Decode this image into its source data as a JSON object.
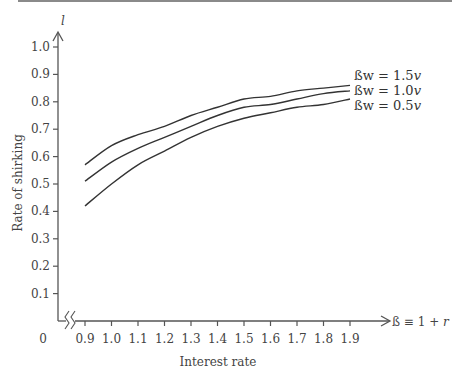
{
  "chart_data": {
    "type": "line",
    "title": "",
    "xlabel": "Interest rate",
    "ylabel": "Rate of shirking",
    "x_axis_symbol": "ß ≡ 1 + r",
    "y_axis_symbol": "l",
    "x_origin_label": "0",
    "x_axis_break": true,
    "xlim": [
      0.9,
      1.9
    ],
    "ylim": [
      0,
      1.0
    ],
    "x_ticks": [
      "0.9",
      "1.0",
      "1.1",
      "1.2",
      "1.3",
      "1.4",
      "1.5",
      "1.6",
      "1.7",
      "1.8",
      "1.9"
    ],
    "y_ticks": [
      "0.1",
      "0.2",
      "0.3",
      "0.4",
      "0.5",
      "0.6",
      "0.7",
      "0.8",
      "0.9",
      "1.0"
    ],
    "grid": false,
    "legend_position": "inline-right",
    "x": [
      0.9,
      1.0,
      1.1,
      1.2,
      1.3,
      1.4,
      1.5,
      1.6,
      1.7,
      1.8,
      1.9
    ],
    "series": [
      {
        "name": "ßw = 1.5v",
        "values": [
          0.57,
          0.64,
          0.68,
          0.71,
          0.75,
          0.78,
          0.81,
          0.82,
          0.84,
          0.85,
          0.86
        ]
      },
      {
        "name": "ßw = 1.0v",
        "values": [
          0.51,
          0.58,
          0.63,
          0.67,
          0.71,
          0.75,
          0.78,
          0.79,
          0.81,
          0.83,
          0.84
        ]
      },
      {
        "name": "ßw = 0.5v",
        "values": [
          0.42,
          0.5,
          0.57,
          0.62,
          0.67,
          0.71,
          0.74,
          0.76,
          0.78,
          0.79,
          0.81
        ]
      }
    ]
  },
  "legend": {
    "items": [
      {
        "prefix": "ßw = 1.5",
        "suffix": "v"
      },
      {
        "prefix": "ßw = 1.0",
        "suffix": "v"
      },
      {
        "prefix": "ßw = 0.5",
        "suffix": "v"
      }
    ]
  },
  "axes": {
    "y_symbol": "l",
    "x_symbol_prefix": "ß ≡ 1 + ",
    "x_symbol_var": "r",
    "origin": "0",
    "xlabel": "Interest rate",
    "ylabel": "Rate of shirking"
  }
}
